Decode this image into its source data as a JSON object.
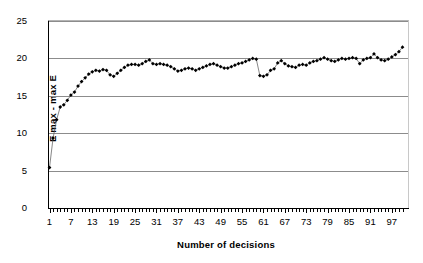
{
  "chart_data": {
    "type": "line",
    "title": "",
    "xlabel": "Number of decisions",
    "ylabel": "E max - max E",
    "xlim": [
      1,
      100
    ],
    "ylim": [
      0,
      25
    ],
    "yticks": [
      0,
      5,
      10,
      15,
      20,
      25
    ],
    "xticks": [
      1,
      7,
      13,
      19,
      25,
      31,
      37,
      43,
      49,
      55,
      61,
      67,
      73,
      79,
      85,
      91,
      97
    ],
    "grid": "horizontal",
    "legend": "none",
    "marker": "filled-diamond",
    "marker_color": "#000000",
    "line_color": "#555555",
    "x": [
      1,
      2,
      3,
      4,
      5,
      6,
      7,
      8,
      9,
      10,
      11,
      12,
      13,
      14,
      15,
      16,
      17,
      18,
      19,
      20,
      21,
      22,
      23,
      24,
      25,
      26,
      27,
      28,
      29,
      30,
      31,
      32,
      33,
      34,
      35,
      36,
      37,
      38,
      39,
      40,
      41,
      42,
      43,
      44,
      45,
      46,
      47,
      48,
      49,
      50,
      51,
      52,
      53,
      54,
      55,
      56,
      57,
      58,
      59,
      60,
      61,
      62,
      63,
      64,
      65,
      66,
      67,
      68,
      69,
      70,
      71,
      72,
      73,
      74,
      75,
      76,
      77,
      78,
      79,
      80,
      81,
      82,
      83,
      84,
      85,
      86,
      87,
      88,
      89,
      90,
      91,
      92,
      93,
      94,
      95,
      96,
      97,
      98,
      99,
      100
    ],
    "values": [
      5.4,
      9.35,
      11.8,
      13.5,
      13.8,
      14.4,
      15.1,
      15.5,
      16.3,
      16.9,
      17.4,
      17.9,
      18.2,
      18.4,
      18.3,
      18.5,
      18.4,
      17.8,
      17.6,
      18.0,
      18.4,
      18.8,
      19.1,
      19.2,
      19.2,
      19.1,
      19.3,
      19.6,
      19.8,
      19.3,
      19.2,
      19.3,
      19.2,
      19.1,
      18.9,
      18.6,
      18.3,
      18.4,
      18.6,
      18.7,
      18.6,
      18.4,
      18.6,
      18.8,
      19.0,
      19.2,
      19.3,
      19.1,
      18.9,
      18.7,
      18.7,
      18.9,
      19.1,
      19.3,
      19.4,
      19.6,
      19.8,
      20.0,
      19.9,
      17.7,
      17.6,
      17.8,
      18.4,
      18.6,
      19.4,
      19.7,
      19.3,
      19.0,
      18.9,
      18.8,
      19.1,
      19.2,
      19.1,
      19.4,
      19.6,
      19.7,
      19.9,
      20.1,
      19.9,
      19.7,
      19.6,
      19.8,
      20.0,
      19.9,
      20.0,
      20.1,
      20.0,
      19.3,
      19.8,
      20.0,
      20.1,
      20.6,
      20.1,
      19.8,
      19.7,
      19.9,
      20.2,
      20.5,
      20.9,
      21.5
    ]
  }
}
